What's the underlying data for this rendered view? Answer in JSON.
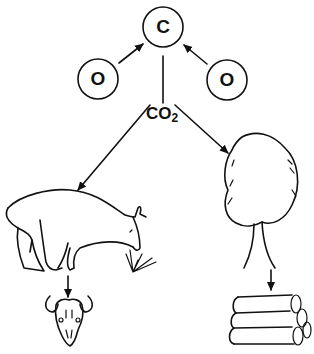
{
  "diagram": {
    "atoms": {
      "carbon": "C",
      "oxygen_left": "O",
      "oxygen_right": "O"
    },
    "molecule": {
      "main": "CO",
      "subscript": "2"
    },
    "nodes": [
      "sheep grazing on grass",
      "tree",
      "animal skull",
      "stacked logs"
    ],
    "edges": [
      {
        "from": "O (left)",
        "to": "C"
      },
      {
        "from": "O (right)",
        "to": "C"
      },
      {
        "from": "C",
        "to": "CO2"
      },
      {
        "from": "CO2",
        "to": "sheep"
      },
      {
        "from": "CO2",
        "to": "tree"
      },
      {
        "from": "sheep",
        "to": "skull"
      },
      {
        "from": "tree",
        "to": "logs"
      }
    ],
    "colors": {
      "line": "#111111",
      "background": "#ffffff"
    }
  }
}
